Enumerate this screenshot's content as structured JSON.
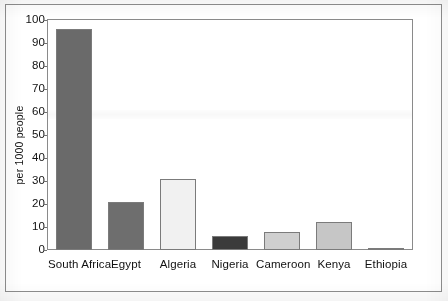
{
  "chart_data": {
    "type": "bar",
    "title": "",
    "xlabel": "",
    "ylabel": "per 1000 people",
    "ylim": [
      0,
      100
    ],
    "yticks": [
      "0",
      "10",
      "20",
      "30",
      "40",
      "50",
      "60",
      "70",
      "80",
      "90",
      "100"
    ],
    "grid": false,
    "legend": "none",
    "categories": [
      "South Africa",
      "Egypt",
      "Algeria",
      "Nigeria",
      "Cameroon",
      "Kenya",
      "Ethiopia"
    ],
    "values": [
      96,
      21,
      31,
      6,
      8,
      12,
      1
    ],
    "bar_colors": [
      "#6a6a6a",
      "#6e6e6e",
      "#f1f1f1",
      "#3b3b3b",
      "#cfcfcf",
      "#c6c6c6",
      "#d8d8d8"
    ],
    "bar_border_color": "#7b7b7b"
  },
  "axes": {
    "y_axis_title": "per 1000 people",
    "tick_labels": [
      "100",
      "90",
      "80",
      "70",
      "60",
      "50",
      "40",
      "30",
      "20",
      "10",
      "0"
    ]
  },
  "colors": {
    "plot_border": "#8a8a8a",
    "page_border": "#8d8d8d",
    "text": "#111111",
    "page_background": "#ffffff"
  }
}
